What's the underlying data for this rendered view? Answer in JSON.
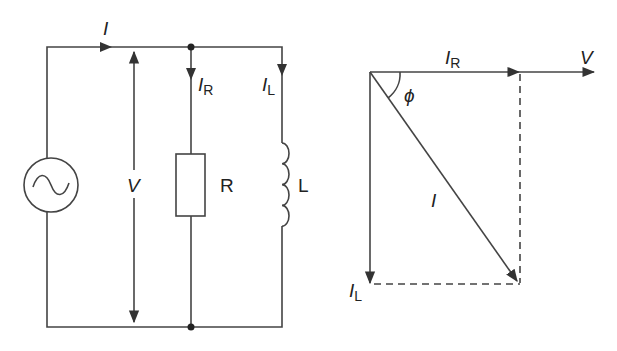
{
  "circuit": {
    "source_icon": "ac-source",
    "current_total": "I",
    "voltage": "V",
    "branch_resistor_current": {
      "main": "I",
      "sub": "R"
    },
    "branch_inductor_current": {
      "main": "I",
      "sub": "L"
    },
    "resistor_label": "R",
    "inductor_label": "L"
  },
  "phasor": {
    "ir": {
      "main": "I",
      "sub": "R"
    },
    "v": "V",
    "phi": "ϕ",
    "i": "I",
    "il": {
      "main": "I",
      "sub": "L"
    }
  },
  "colors": {
    "line": "#333333",
    "background": "#ffffff"
  }
}
